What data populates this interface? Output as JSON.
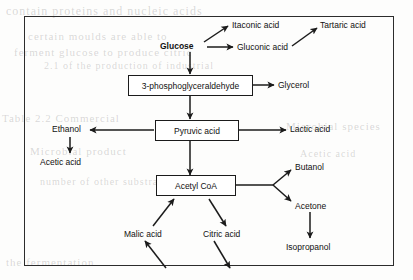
{
  "figure": {
    "type": "metabolic-pathway-flow-diagram",
    "border_color": "#2c2c2c",
    "text_color": "#111111",
    "arrow_color": "#1b1b1b",
    "background": "#fdfdfc"
  },
  "nodes": {
    "glucose": "Glucose",
    "itaconic_acid": "Itaconic acid",
    "gluconic_acid": "Gluconic acid",
    "tartaric_acid": "Tartaric acid",
    "phosphoglyceraldehyde": "3-phosphoglyceraldehyde",
    "glycerol": "Glycerol",
    "pyruvic_acid": "Pyruvic acid",
    "ethanol": "Ethanol",
    "acetic_acid": "Acetic acid",
    "lactic_acid": "Lactic acid",
    "acetyl_coa": "Acetyl CoA",
    "malic_acid": "Malic acid",
    "citric_acid": "Citric acid",
    "butanol": "Butanol",
    "acetone": "Acetone",
    "isopropanol": "Isopropanol"
  },
  "edges": [
    {
      "from": "glucose",
      "to": "itaconic_acid"
    },
    {
      "from": "glucose",
      "to": "gluconic_acid"
    },
    {
      "from": "gluconic_acid",
      "to": "tartaric_acid"
    },
    {
      "from": "glucose",
      "to": "phosphoglyceraldehyde"
    },
    {
      "from": "phosphoglyceraldehyde",
      "to": "glycerol"
    },
    {
      "from": "phosphoglyceraldehyde",
      "to": "pyruvic_acid"
    },
    {
      "from": "pyruvic_acid",
      "to": "ethanol"
    },
    {
      "from": "ethanol",
      "to": "acetic_acid"
    },
    {
      "from": "pyruvic_acid",
      "to": "lactic_acid"
    },
    {
      "from": "pyruvic_acid",
      "to": "acetyl_coa"
    },
    {
      "from": "malic_acid",
      "to": "acetyl_coa"
    },
    {
      "from": "acetyl_coa",
      "to": "citric_acid"
    },
    {
      "from": "acetyl_coa",
      "to": "butanol"
    },
    {
      "from": "acetyl_coa",
      "to": "acetone"
    },
    {
      "from": "acetone",
      "to": "isopropanol"
    },
    {
      "from": "cycle_below",
      "to": "malic_acid"
    },
    {
      "from": "citric_acid",
      "to": "cycle_below"
    }
  ],
  "background_text": {
    "line1": "contain proteins and nucleic acids",
    "line2": "certain moulds are able to",
    "line3": "ferment glucose to produce citric",
    "line4": "2.1 of the production of industrial",
    "line5": "Table 2.2 Commercial",
    "line6": "Microbial product",
    "line7": "number of other substrates",
    "line8": "the fermentation",
    "line9": "Microbial species",
    "line10": "Acetic acid"
  }
}
